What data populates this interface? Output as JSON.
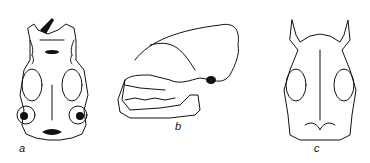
{
  "figure": {
    "panels": [
      {
        "id": "a",
        "label": "a",
        "view": "ventral"
      },
      {
        "id": "b",
        "label": "b",
        "view": "lateral"
      },
      {
        "id": "c",
        "label": "c",
        "view": "dorsal"
      }
    ]
  }
}
